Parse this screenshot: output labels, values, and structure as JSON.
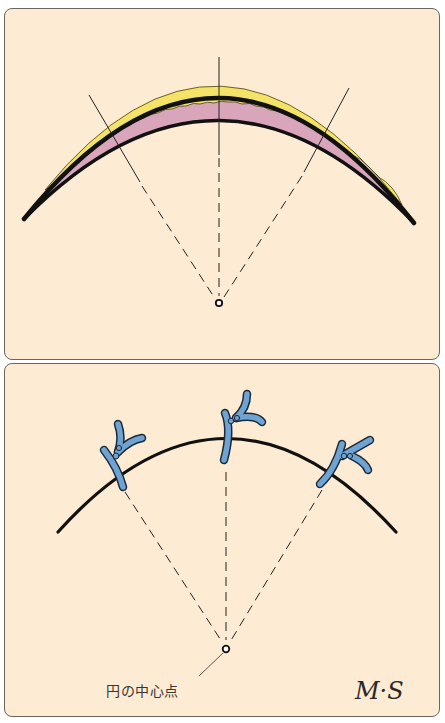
{
  "figure": {
    "top_panel": {
      "description": "Crescent-shaped tissue cross-section with three lines converging at circle center",
      "colors": {
        "outline": "#111111",
        "outer_layer": "#f3e468",
        "inner_layer": "#d9a5bb",
        "background": "#fdebd3"
      },
      "radial_line_count": 3
    },
    "bottom_panel": {
      "description": "Arc with three blue chromosome-like markers placed on radial lines from circle center",
      "colors": {
        "arc": "#111111",
        "marker_fill": "#6fa3d2",
        "marker_outline": "#1a2a3a",
        "background": "#fdebd3"
      },
      "marker_count": 3
    },
    "labels": {
      "center_point": "円の中心点",
      "signature": "M·S"
    }
  }
}
